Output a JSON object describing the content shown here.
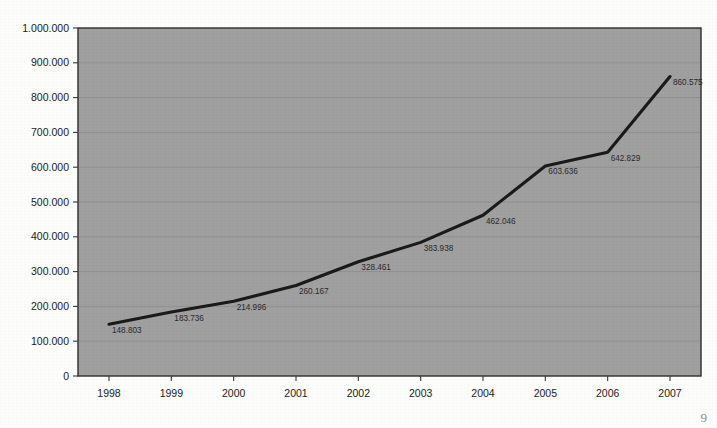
{
  "chart_data": {
    "type": "line",
    "title": "",
    "subtitle": "",
    "xlabel": "",
    "ylabel": "",
    "categories": [
      "1998",
      "1999",
      "2000",
      "2001",
      "2002",
      "2003",
      "2004",
      "2005",
      "2006",
      "2007"
    ],
    "values": [
      148803,
      183736,
      214996,
      260167,
      328461,
      383938,
      462046,
      603636,
      642829,
      860575
    ],
    "point_labels": [
      "148.803",
      "183.736",
      "214.996",
      "260.167",
      "328.461",
      "383.938",
      "462.046",
      "603.636",
      "642.829",
      "860.575"
    ],
    "ylim": [
      0,
      1000000
    ],
    "ytick_values": [
      0,
      100000,
      200000,
      300000,
      400000,
      500000,
      600000,
      700000,
      800000,
      900000,
      1000000
    ],
    "ytick_labels": [
      "0",
      "100.000",
      "200.000",
      "300.000",
      "400.000",
      "500.000",
      "600.000",
      "700.000",
      "800.000",
      "900.000",
      "1.000.000"
    ],
    "grid": true,
    "grid_axis": "y",
    "legend": false,
    "legend_position": "none",
    "series": [
      {
        "name": "",
        "values": [
          148803,
          183736,
          214996,
          260167,
          328461,
          383938,
          462046,
          603636,
          642829,
          860575
        ]
      }
    ]
  },
  "style": {
    "plot_background": "#a0a0a0",
    "page_background": "#fdfdfc",
    "line_color": "#1a1a1a",
    "gridline_color": "#8f8f8f",
    "axis_color": "#3a3a3a",
    "tick_text_color": "#1b1b1b",
    "point_label_color": "#2a2a2a"
  },
  "corner_mark": {
    "text": "9"
  }
}
